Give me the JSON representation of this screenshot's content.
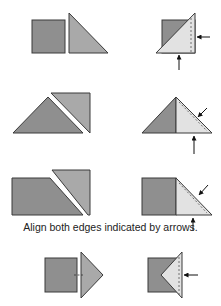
{
  "caption": "Align both edges indicated by arrows.",
  "colors": {
    "dark_fabric": "#8f8f8f",
    "medium_fabric": "#a9a9a9",
    "light_fabric": "#e2e2e2",
    "outline": "#3a3a3a",
    "arrow": "#111111"
  },
  "rows": [
    {
      "name": "square-and-triangle",
      "left": "pieces separated",
      "right": "triangle placed on square, edges aligned"
    },
    {
      "name": "two-triangles",
      "left": "pieces separated",
      "right": "triangles joined, edges aligned"
    },
    {
      "name": "trapezoid-and-triangle",
      "left": "pieces separated",
      "right": "triangle joined to square, edges aligned"
    },
    {
      "name": "square-and-point",
      "left": "pieces separated",
      "right": "triangle point folded onto square"
    }
  ]
}
